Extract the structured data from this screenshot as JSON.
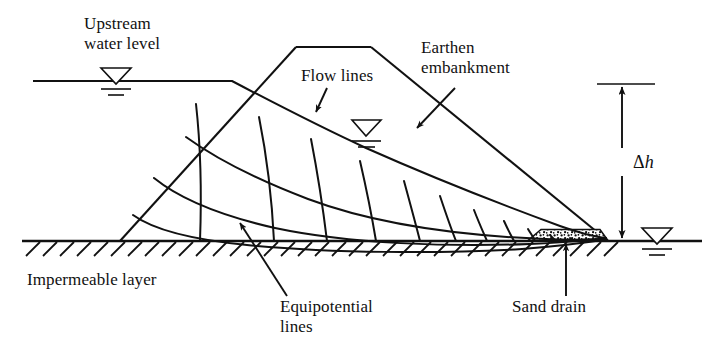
{
  "figure": {
    "type": "engineering-cross-section",
    "background_color": "#ffffff",
    "line_color": "#111111",
    "width": 710,
    "height": 355
  },
  "labels": {
    "upstream_water_level": "Upstream\nwater level",
    "flow_lines": "Flow lines",
    "earthen_embankment": "Earthen\nembankment",
    "head_difference_delta": "Δ",
    "head_difference_symbol": "h",
    "impermeable_layer": "Impermeable layer",
    "equipotential_lines": "Equipotential\nlines",
    "sand_drain": "Sand drain"
  },
  "geometry": {
    "ground_line": {
      "x1": 22,
      "y1": 241,
      "x2": 702,
      "y2": 241
    },
    "upstream_water_line": {
      "x1": 33,
      "y1": 81,
      "x2": 232,
      "y2": 81
    },
    "downstream_water_line": {
      "x1": 612,
      "y1": 241,
      "x2": 702,
      "y2": 241
    },
    "embankment_crest": {
      "x1": 296,
      "y1": 47,
      "x2": 371,
      "y2": 47
    },
    "embankment_upstream_toe": {
      "x": 120,
      "y": 241
    },
    "embankment_downstream_toe": {
      "x": 608,
      "y": 241
    },
    "sand_drain_region": {
      "x_left": 528,
      "x_right": 608,
      "y_top": 230,
      "y_bottom": 241
    },
    "delta_h_dimension": {
      "x": 622,
      "y_top": 84,
      "y_bottom": 240
    }
  },
  "symbols": {
    "water_surface_triangle": "inverted-triangle-with-two-dashes",
    "hatching": "impermeable-layer-hatch",
    "stipple": "sand-drain-stipple"
  },
  "annotations": [
    {
      "name": "flow-lines-arrow",
      "from": [
        325,
        90
      ],
      "to": [
        316,
        113
      ]
    },
    {
      "name": "earthen-embankment-arrow",
      "from": [
        452,
        92
      ],
      "to": [
        417,
        128
      ]
    },
    {
      "name": "equipotential-lines-arrow",
      "from": [
        283,
        290
      ],
      "to": [
        239,
        224
      ]
    },
    {
      "name": "sand-drain-arrow",
      "from": [
        566,
        292
      ],
      "to": [
        566,
        244
      ]
    }
  ],
  "flow_net": {
    "description": "Curvilinear flow net: flow lines run from the upstream slope toward the sand drain; equipotential lines cross them at right angles.",
    "flow_line_count": 5,
    "equipotential_line_count": 11
  }
}
